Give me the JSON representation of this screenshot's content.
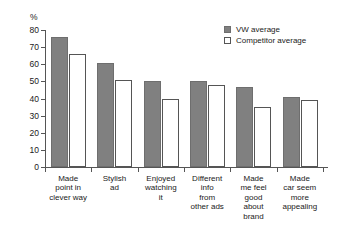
{
  "chart_data": {
    "type": "bar",
    "title": "",
    "xlabel": "",
    "ylabel": "%",
    "ylim": [
      0,
      80
    ],
    "yticks": [
      0,
      10,
      20,
      30,
      40,
      50,
      60,
      70,
      80
    ],
    "grid": false,
    "legend_position": "top-right",
    "categories": [
      "Made point in clever way",
      "Stylish ad",
      "Enjoyed watching it",
      "Different info from other ads",
      "Made me feel good about brand",
      "Made car seem more appealing"
    ],
    "category_lines": [
      [
        "Made",
        "point in",
        "clever way"
      ],
      [
        "Stylish",
        "ad"
      ],
      [
        "Enjoyed",
        "watching",
        "it"
      ],
      [
        "Different",
        "info",
        "from",
        "other ads"
      ],
      [
        "Made",
        "me feel",
        "good",
        "about",
        "brand"
      ],
      [
        "Made",
        "car seem",
        "more",
        "appealing"
      ]
    ],
    "series": [
      {
        "name": "VW average",
        "color": "#808080",
        "values": [
          76,
          61,
          50,
          50,
          47,
          41
        ]
      },
      {
        "name": "Competitor average",
        "color": "#ffffff",
        "values": [
          66,
          51,
          40,
          48,
          35,
          39
        ]
      }
    ]
  },
  "axis": {
    "y_unit_label": "%"
  },
  "legend": {
    "items": [
      {
        "label": "VW average",
        "style": "filled"
      },
      {
        "label": "Competitor average",
        "style": "outline"
      }
    ]
  }
}
